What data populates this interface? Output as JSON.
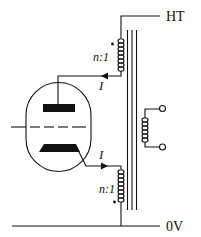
{
  "diagram": {
    "type": "push-pull valve output stage with transformer",
    "labels": {
      "supply_top": "HT",
      "supply_bottom": "0V",
      "ratio_upper": "n:1",
      "ratio_lower": "n:1",
      "current_upper": "I",
      "current_lower": "I"
    },
    "components": [
      {
        "id": "valve",
        "name": "triode valve"
      },
      {
        "id": "anode",
        "name": "anode plate"
      },
      {
        "id": "grid",
        "name": "control grid"
      },
      {
        "id": "cathode",
        "name": "cathode"
      },
      {
        "id": "primary-upper",
        "name": "upper primary winding"
      },
      {
        "id": "primary-lower",
        "name": "lower primary winding"
      },
      {
        "id": "core",
        "name": "transformer core"
      },
      {
        "id": "secondary",
        "name": "secondary winding"
      },
      {
        "id": "output-terminals",
        "name": "output terminals"
      }
    ],
    "colors": {
      "ink": "#111111",
      "background": "#ffffff"
    }
  }
}
